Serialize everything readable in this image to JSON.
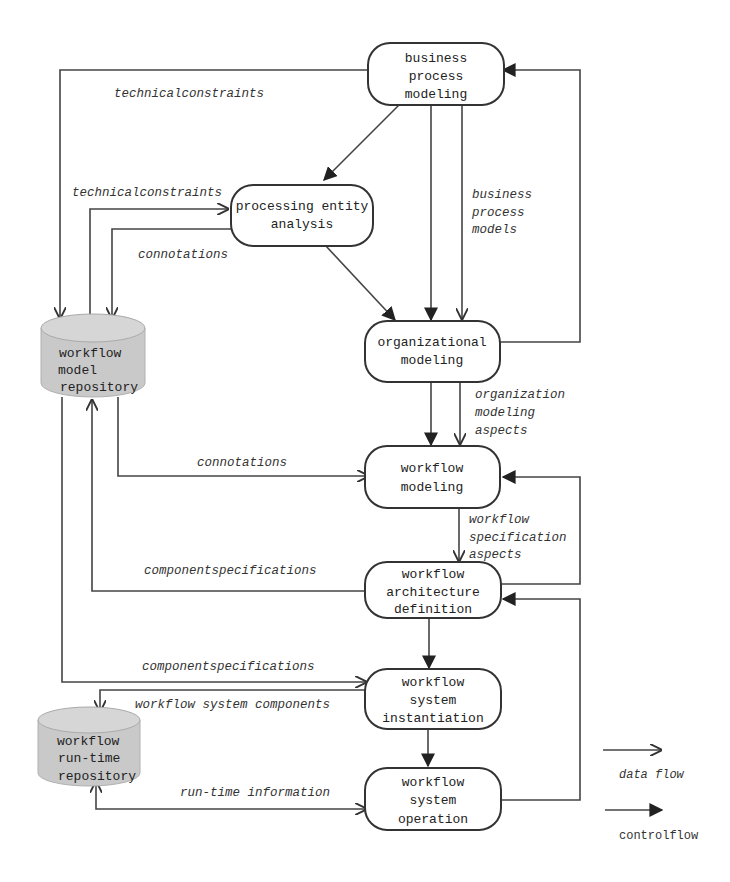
{
  "nodes": {
    "business_process_modeling": {
      "lines": [
        "business",
        "process",
        "modeling"
      ]
    },
    "processing_entity_analysis": {
      "lines": [
        "processing entity",
        "analysis"
      ]
    },
    "organizational_modeling": {
      "lines": [
        "organizational",
        "modeling"
      ]
    },
    "workflow_modeling": {
      "lines": [
        "workflow",
        "modeling"
      ]
    },
    "workflow_architecture_definition": {
      "lines": [
        "workflow",
        "architecture",
        "definition"
      ]
    },
    "workflow_system_instantiation": {
      "lines": [
        "workflow",
        "system",
        "instantiation"
      ]
    },
    "workflow_system_operation": {
      "lines": [
        "workflow",
        "system",
        "operation"
      ]
    }
  },
  "repositories": {
    "workflow_model_repository": {
      "lines": [
        "workflow",
        "model",
        "repository"
      ]
    },
    "workflow_runtime_repository": {
      "lines": [
        "workflow",
        "run-time",
        "repository"
      ]
    }
  },
  "edge_labels": {
    "technical_constraints_top": "technicalconstraints",
    "technical_constraints_mid": "technicalconstraints",
    "connotations_upper": "connotations",
    "business_process_models": [
      "business",
      "process",
      "models"
    ],
    "organization_modeling_aspects": [
      "organization",
      "modeling",
      "aspects"
    ],
    "connotations_lower": "connotations",
    "workflow_specification_aspects": [
      "workflow",
      "specification",
      "aspects"
    ],
    "component_specifications_upper": "componentspecifications",
    "component_specifications_lower": "componentspecifications",
    "workflow_system_components": "workflow system components",
    "runtime_information": "run-time information"
  },
  "legend": {
    "data_flow": "data flow",
    "control_flow": "controlflow"
  },
  "colors": {
    "line": "#444444",
    "box_stroke": "#333333",
    "repository_fill": "#c9c9c9"
  }
}
